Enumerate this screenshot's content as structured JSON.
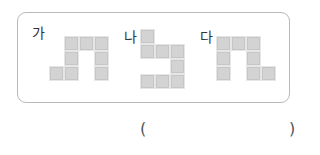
{
  "figures": [
    {
      "label": "가",
      "cell_size": 15,
      "origin": [
        49,
        36
      ],
      "cells": [
        [
          1,
          0
        ],
        [
          2,
          0
        ],
        [
          3,
          0
        ],
        [
          1,
          1
        ],
        [
          3,
          1
        ],
        [
          0,
          2
        ],
        [
          1,
          2
        ],
        [
          3,
          2
        ]
      ]
    },
    {
      "label": "나",
      "cell_size": 15,
      "origin": [
        140,
        29
      ],
      "cells": [
        [
          0,
          0
        ],
        [
          0,
          1
        ],
        [
          1,
          1
        ],
        [
          2,
          1
        ],
        [
          2,
          2
        ],
        [
          0,
          3
        ],
        [
          1,
          3
        ],
        [
          2,
          3
        ]
      ]
    },
    {
      "label": "다",
      "cell_size": 15,
      "origin": [
        216,
        36
      ],
      "cells": [
        [
          0,
          0
        ],
        [
          1,
          0
        ],
        [
          2,
          0
        ],
        [
          0,
          1
        ],
        [
          2,
          1
        ],
        [
          0,
          2
        ],
        [
          2,
          2
        ],
        [
          3,
          2
        ]
      ]
    }
  ],
  "answer": {
    "open_paren": "(",
    "close_paren": ")"
  },
  "colors": {
    "cell_fill": "#d3d3d3",
    "frame_border": "#b8b8b8"
  }
}
